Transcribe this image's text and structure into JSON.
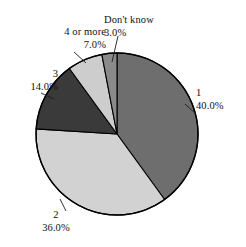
{
  "chart_data": {
    "type": "pie",
    "title": "",
    "subtitle": "",
    "xlabel": "",
    "ylabel": "",
    "legend": "none",
    "grid": false,
    "units": "percent",
    "start_angle_deg": 0,
    "direction": "clockwise",
    "categories": [
      "1",
      "2",
      "3",
      "4 or more",
      "Don't know"
    ],
    "values": [
      40.0,
      36.0,
      14.0,
      7.0,
      3.0
    ],
    "slices": [
      {
        "label": "1",
        "value_text": "40.0%",
        "value": 40.0,
        "color": "#6e6e6e",
        "label_position": "right"
      },
      {
        "label": "2",
        "value_text": "36.0%",
        "value": 36.0,
        "color": "#d2d2d2",
        "label_position": "bottom"
      },
      {
        "label": "3",
        "value_text": "14.0%",
        "value": 14.0,
        "color": "#3a3a3a",
        "label_position": "left"
      },
      {
        "label": "4 or more",
        "value_text": "7.0%",
        "value": 7.0,
        "color": "#cdcdcd",
        "label_position": "upper-left"
      },
      {
        "label": "Don't know",
        "value_text": "3.0%",
        "value": 3.0,
        "color": "#8a8a8a",
        "label_position": "top"
      }
    ],
    "outline_color": "#000000",
    "background_color": "#ffffff"
  }
}
